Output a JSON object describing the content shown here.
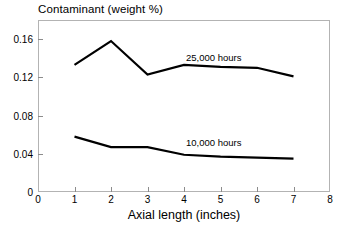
{
  "chart_data": {
    "type": "line",
    "title": "Contaminant (weight %)",
    "subtitle": "",
    "xlabel": "Axial length (inches)",
    "ylabel": "Contaminant (weight %)",
    "xlim": [
      0,
      8
    ],
    "ylim": [
      0,
      0.18
    ],
    "grid": false,
    "legend_position": "inline-annotation",
    "x": [
      1,
      2,
      3,
      4,
      5,
      6,
      7
    ],
    "xticks": [
      "0",
      "1",
      "2",
      "3",
      "4",
      "5",
      "6",
      "7",
      "8"
    ],
    "xtick_values": [
      0,
      1,
      2,
      3,
      4,
      5,
      6,
      7,
      8
    ],
    "yticks": [
      "0",
      "0.04",
      "0.08",
      "0.12",
      "0.16"
    ],
    "ytick_values": [
      0,
      0.04,
      0.08,
      0.12,
      0.16
    ],
    "series": [
      {
        "name": "25,000 hours",
        "label": "25,000 hours",
        "color": "#000000",
        "values": [
          0.133,
          0.158,
          0.123,
          0.133,
          0.131,
          0.13,
          0.121
        ]
      },
      {
        "name": "10,000 hours",
        "label": "10,000 hours",
        "color": "#000000",
        "values": [
          0.058,
          0.047,
          0.047,
          0.039,
          0.037,
          0.036,
          0.035
        ]
      }
    ],
    "annotations": [
      {
        "text": "25,000 hours",
        "x": 4.1,
        "y": 0.146
      },
      {
        "text": "10,000 hours",
        "x": 4.1,
        "y": 0.052
      }
    ],
    "colors": {
      "line": "#000000",
      "frame": "#b3b3b3",
      "tick": "#8c8c8c",
      "background": "#ffffff",
      "text": "#000000"
    }
  }
}
